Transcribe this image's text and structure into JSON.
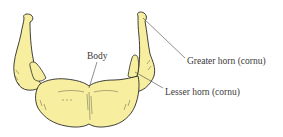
{
  "figure": {
    "colors": {
      "bone_fill": "#f7ef9f",
      "outline": "#2a2a2a",
      "leader_line": "#444444",
      "label_text": "#3a3a3a",
      "background": "#ffffff"
    },
    "labels": [
      {
        "id": "body",
        "text": "Body",
        "x": 87,
        "y": 52
      },
      {
        "id": "greater-horn",
        "text": "Greater horn (cornu)",
        "x": 187,
        "y": 57
      },
      {
        "id": "lesser-horn",
        "text": "Lesser horn (cornu)",
        "x": 165,
        "y": 88
      }
    ]
  }
}
